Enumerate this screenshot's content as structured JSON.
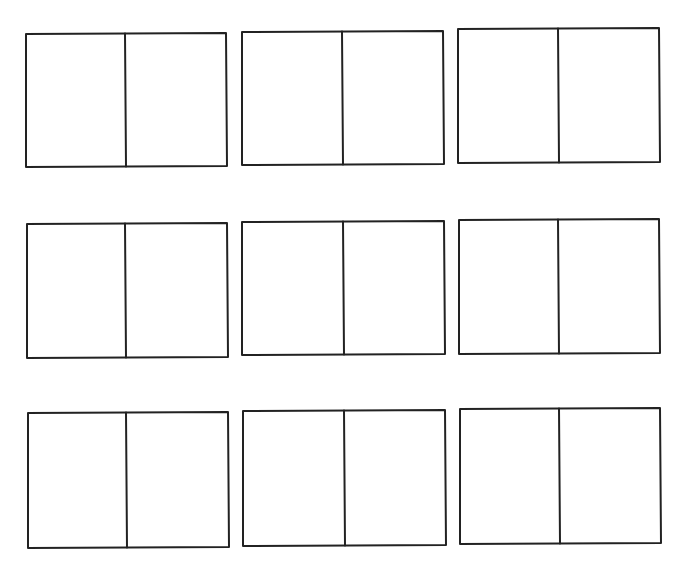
{
  "page": {
    "background": "#ffffff",
    "stroke_color": "#222222"
  },
  "grid": {
    "rows": 3,
    "cols": 3,
    "boxes": [
      {
        "id": 1,
        "row": 1,
        "col": 1,
        "x1": 26,
        "y1": 34,
        "x2": 226,
        "y2": 167,
        "divider_x": 125
      },
      {
        "id": 2,
        "row": 1,
        "col": 2,
        "x1": 242,
        "y1": 32,
        "x2": 443,
        "y2": 165,
        "divider_x": 342
      },
      {
        "id": 3,
        "row": 1,
        "col": 3,
        "x1": 458,
        "y1": 29,
        "x2": 659,
        "y2": 163,
        "divider_x": 558
      },
      {
        "id": 4,
        "row": 2,
        "col": 1,
        "x1": 27,
        "y1": 224,
        "x2": 227,
        "y2": 358,
        "divider_x": 125
      },
      {
        "id": 5,
        "row": 2,
        "col": 2,
        "x1": 242,
        "y1": 222,
        "x2": 444,
        "y2": 355,
        "divider_x": 343
      },
      {
        "id": 6,
        "row": 2,
        "col": 3,
        "x1": 459,
        "y1": 220,
        "x2": 659,
        "y2": 354,
        "divider_x": 558
      },
      {
        "id": 7,
        "row": 3,
        "col": 1,
        "x1": 28,
        "y1": 413,
        "x2": 228,
        "y2": 548,
        "divider_x": 126
      },
      {
        "id": 8,
        "row": 3,
        "col": 2,
        "x1": 243,
        "y1": 411,
        "x2": 445,
        "y2": 546,
        "divider_x": 344
      },
      {
        "id": 9,
        "row": 3,
        "col": 3,
        "x1": 460,
        "y1": 409,
        "x2": 660,
        "y2": 544,
        "divider_x": 559
      }
    ]
  }
}
